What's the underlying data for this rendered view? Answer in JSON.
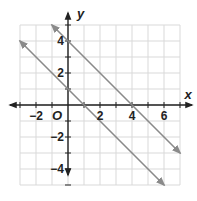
{
  "chart_data": {
    "type": "line",
    "title": "",
    "xlabel": "x",
    "ylabel": "y",
    "origin_label": "O",
    "xlim": [
      -3,
      7
    ],
    "ylim": [
      -5,
      5
    ],
    "grid": true,
    "x_ticks": [
      -2,
      2,
      4,
      6
    ],
    "y_ticks": [
      -4,
      -2,
      2,
      4
    ],
    "series": [
      {
        "name": "line-upper",
        "equation": "y = -x + 4",
        "points": [
          [
            -1,
            5
          ],
          [
            7,
            -3
          ]
        ],
        "color": "#8a8a8a",
        "arrows": "both"
      },
      {
        "name": "line-lower",
        "equation": "y = -x + 1",
        "points": [
          [
            -3,
            4
          ],
          [
            6,
            -5
          ]
        ],
        "color": "#8a8a8a",
        "arrows": "both"
      }
    ],
    "colors": {
      "grid": "#d9d9d9",
      "axis": "#222222"
    }
  }
}
